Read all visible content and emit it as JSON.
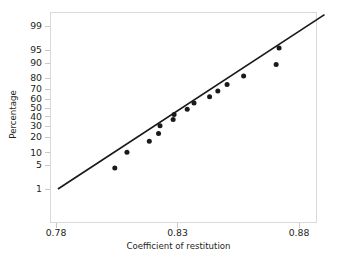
{
  "chart_data": {
    "type": "scatter",
    "title": "",
    "subtitle": "",
    "xlabel": "Coefficient of restitution",
    "ylabel": "Percentage",
    "grid": false,
    "legend": false,
    "legend_position": "none",
    "xlim": [
      0.78,
      0.8905
    ],
    "ylim_percent": [
      1,
      99
    ],
    "y_scale": "normal-probability",
    "xticks": [
      "0.78",
      "0.83",
      "0.88"
    ],
    "xtick_values": [
      0.78,
      0.83,
      0.88
    ],
    "yticks": [
      "99",
      "95",
      "90",
      "80",
      "70",
      "60",
      "50",
      "40",
      "30",
      "20",
      "10",
      "5",
      "1"
    ],
    "ytick_values": [
      99,
      95,
      90,
      80,
      70,
      60,
      50,
      40,
      30,
      20,
      10,
      5,
      1
    ],
    "series": [
      {
        "name": "Coefficient of restitution",
        "marker": "filled-circle",
        "color": "#1a1a1a",
        "points": [
          {
            "x": 0.8042,
            "percent": 4.2
          },
          {
            "x": 0.8092,
            "percent": 10.1
          },
          {
            "x": 0.8184,
            "percent": 16.8
          },
          {
            "x": 0.8222,
            "percent": 23.0
          },
          {
            "x": 0.8228,
            "percent": 30.0
          },
          {
            "x": 0.8282,
            "percent": 36.5
          },
          {
            "x": 0.8286,
            "percent": 42.0
          },
          {
            "x": 0.834,
            "percent": 48.0
          },
          {
            "x": 0.8368,
            "percent": 55.0
          },
          {
            "x": 0.8432,
            "percent": 62.0
          },
          {
            "x": 0.8466,
            "percent": 68.0
          },
          {
            "x": 0.8504,
            "percent": 74.5
          },
          {
            "x": 0.8572,
            "percent": 81.5
          },
          {
            "x": 0.8706,
            "percent": 89.0
          },
          {
            "x": 0.8718,
            "percent": 95.5
          }
        ]
      }
    ],
    "fit_line": {
      "name": "normal-reference-line",
      "color": "#1a1a1a",
      "x_start": 0.7808,
      "percent_start": 1.0,
      "x_end": 0.8905,
      "percent_end": 99.6
    },
    "annotations": []
  }
}
